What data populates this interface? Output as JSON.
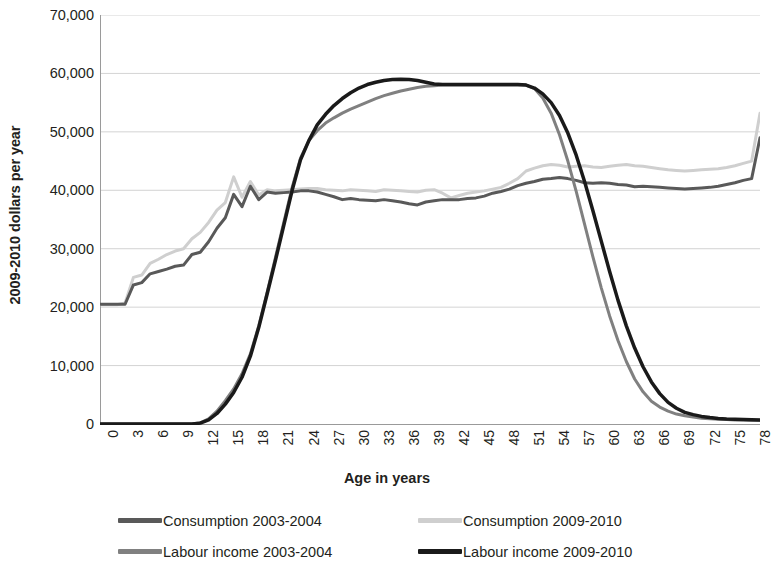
{
  "chart_data": {
    "type": "line",
    "title": "",
    "xlabel": "Age in years",
    "ylabel": "2009-2010 dollars per year",
    "xlim": [
      0,
      79
    ],
    "ylim": [
      0,
      70000
    ],
    "ytick_step": 10000,
    "xtick_step": 3,
    "grid": true,
    "legend_position": "bottom",
    "ytick_labels": [
      "70,000",
      "60,000",
      "50,000",
      "40,000",
      "30,000",
      "20,000",
      "10,000",
      "0"
    ],
    "ytick_values": [
      70000,
      60000,
      50000,
      40000,
      30000,
      20000,
      10000,
      0
    ],
    "xtick_labels": [
      "0",
      "3",
      "6",
      "9",
      "12",
      "15",
      "18",
      "21",
      "24",
      "27",
      "30",
      "33",
      "36",
      "39",
      "42",
      "45",
      "48",
      "51",
      "54",
      "57",
      "60",
      "63",
      "66",
      "69",
      "72",
      "75",
      "78"
    ],
    "xtick_values": [
      0,
      3,
      6,
      9,
      12,
      15,
      18,
      21,
      24,
      27,
      30,
      33,
      36,
      39,
      42,
      45,
      48,
      51,
      54,
      57,
      60,
      63,
      66,
      69,
      72,
      75,
      78
    ],
    "x": [
      0,
      1,
      2,
      3,
      4,
      5,
      6,
      7,
      8,
      9,
      10,
      11,
      12,
      13,
      14,
      15,
      16,
      17,
      18,
      19,
      20,
      21,
      22,
      23,
      24,
      25,
      26,
      27,
      28,
      29,
      30,
      31,
      32,
      33,
      34,
      35,
      36,
      37,
      38,
      39,
      40,
      41,
      42,
      43,
      44,
      45,
      46,
      47,
      48,
      49,
      50,
      51,
      52,
      53,
      54,
      55,
      56,
      57,
      58,
      59,
      60,
      61,
      62,
      63,
      64,
      65,
      66,
      67,
      68,
      69,
      70,
      71,
      72,
      73,
      74,
      75,
      76,
      77,
      78,
      79
    ],
    "series": [
      {
        "name": "Consumption 2003-2004",
        "color": "#595959",
        "width": 3.0,
        "values": [
          20500,
          20500,
          20500,
          20500,
          23800,
          24200,
          25700,
          26100,
          26500,
          27000,
          27200,
          29000,
          29400,
          31200,
          33500,
          35300,
          39300,
          37200,
          40700,
          38400,
          39700,
          39500,
          39600,
          39700,
          39900,
          39900,
          39700,
          39300,
          38900,
          38400,
          38600,
          38400,
          38300,
          38200,
          38400,
          38200,
          38000,
          37700,
          37500,
          38000,
          38200,
          38400,
          38400,
          38400,
          38600,
          38700,
          39000,
          39500,
          39800,
          40200,
          40800,
          41200,
          41500,
          41900,
          42000,
          42200,
          42000,
          41700,
          41300,
          41200,
          41300,
          41200,
          41000,
          40900,
          40600,
          40700,
          40600,
          40500,
          40400,
          40300,
          40200,
          40300,
          40400,
          40500,
          40700,
          41000,
          41300,
          41700,
          42000,
          49000
        ]
      },
      {
        "name": "Consumption 2009-2010",
        "color": "#cfcfcf",
        "width": 3.0,
        "values": [
          20400,
          20400,
          20400,
          20700,
          25100,
          25500,
          27500,
          28200,
          29000,
          29600,
          30000,
          31700,
          32800,
          34500,
          36600,
          37900,
          42300,
          38800,
          41500,
          39200,
          40100,
          39900,
          40000,
          40100,
          40200,
          40300,
          40300,
          40100,
          40000,
          39900,
          40100,
          40000,
          39900,
          39800,
          40100,
          40000,
          39900,
          39800,
          39700,
          40000,
          40100,
          39500,
          38700,
          39100,
          39500,
          39700,
          39900,
          40200,
          40500,
          41200,
          42000,
          43300,
          43800,
          44200,
          44400,
          44300,
          44000,
          44100,
          44200,
          44000,
          43900,
          44100,
          44300,
          44400,
          44200,
          44100,
          43900,
          43700,
          43500,
          43400,
          43300,
          43400,
          43500,
          43600,
          43700,
          43900,
          44200,
          44600,
          45000,
          53200
        ]
      },
      {
        "name": "Labour income 2003-2004",
        "color": "#808080",
        "width": 3.0,
        "values": [
          0,
          0,
          0,
          0,
          0,
          0,
          0,
          0,
          0,
          0,
          0,
          0,
          200,
          900,
          2200,
          4000,
          6000,
          8600,
          12000,
          16800,
          22500,
          28500,
          34500,
          40500,
          45500,
          48500,
          50200,
          51500,
          52400,
          53200,
          53900,
          54500,
          55100,
          55700,
          56200,
          56600,
          57000,
          57300,
          57600,
          57800,
          57900,
          58000,
          58000,
          58000,
          58000,
          58000,
          58000,
          58000,
          58000,
          58000,
          58000,
          58000,
          57400,
          55800,
          53200,
          49500,
          45000,
          39800,
          34200,
          28600,
          23300,
          18500,
          14300,
          10700,
          7700,
          5500,
          3900,
          2900,
          2200,
          1700,
          1400,
          1200,
          1000,
          900,
          800,
          750,
          700,
          680,
          660,
          650
        ]
      },
      {
        "name": "Labour income 2009-2010",
        "color": "#1a1a1a",
        "width": 3.5,
        "values": [
          0,
          0,
          0,
          0,
          0,
          0,
          0,
          0,
          0,
          0,
          0,
          0,
          150,
          700,
          1800,
          3400,
          5400,
          8000,
          11600,
          16500,
          22200,
          28000,
          34000,
          40000,
          45200,
          48500,
          51200,
          53000,
          54500,
          55700,
          56700,
          57500,
          58100,
          58500,
          58800,
          58950,
          59000,
          58950,
          58800,
          58500,
          58200,
          58100,
          58100,
          58100,
          58100,
          58100,
          58100,
          58100,
          58100,
          58100,
          58100,
          58000,
          57500,
          56500,
          55000,
          52800,
          49800,
          46000,
          41500,
          36500,
          31300,
          26100,
          21200,
          16800,
          13000,
          9800,
          7200,
          5200,
          3700,
          2700,
          2000,
          1600,
          1300,
          1100,
          950,
          850,
          800,
          760,
          730,
          700
        ]
      }
    ]
  },
  "axis_titles": {
    "x": "Age in years",
    "y": "2009-2010 dollars per year"
  },
  "legend": {
    "items": [
      {
        "label": "Consumption 2003-2004",
        "color": "#595959"
      },
      {
        "label": "Consumption 2009-2010",
        "color": "#cfcfcf"
      },
      {
        "label": "Labour income 2003-2004",
        "color": "#808080"
      },
      {
        "label": "Labour income 2009-2010",
        "color": "#1a1a1a"
      }
    ]
  }
}
